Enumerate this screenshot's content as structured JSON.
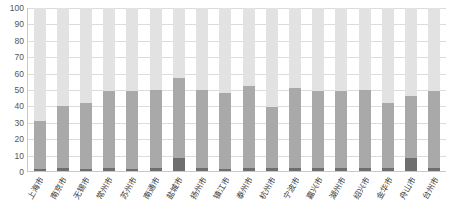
{
  "chart_data": {
    "type": "bar",
    "stacked": true,
    "title": "",
    "subtitle": "",
    "xlabel": "",
    "ylabel": "",
    "ylim": [
      0,
      100
    ],
    "ytick_step": 10,
    "grid": true,
    "legend": "none",
    "yticks": [
      "100",
      "90",
      "80",
      "70",
      "60",
      "50",
      "40",
      "30",
      "20",
      "10",
      "0"
    ],
    "categories": [
      "上海市",
      "南京市",
      "无锡市",
      "常州市",
      "苏州市",
      "南通市",
      "盐城市",
      "扬州市",
      "镇江市",
      "泰州市",
      "杭州市",
      "宁波市",
      "嘉兴市",
      "湖州市",
      "绍兴市",
      "金华市",
      "舟山市",
      "台州市"
    ],
    "series": [
      {
        "name": "bottom-segment",
        "color": "#6e6e6e",
        "values": [
          1,
          2,
          1,
          2,
          1,
          2,
          8,
          2,
          1,
          2,
          2,
          2,
          2,
          2,
          2,
          2,
          8,
          2
        ]
      },
      {
        "name": "middle-segment",
        "color": "#a9a9a9",
        "values": [
          30,
          38,
          41,
          47,
          48,
          48,
          49,
          48,
          47,
          50,
          37,
          49,
          47,
          47,
          48,
          40,
          38,
          47
        ]
      },
      {
        "name": "top-segment",
        "color": "#e2e2e2",
        "values": [
          69,
          60,
          58,
          51,
          51,
          50,
          43,
          50,
          52,
          48,
          61,
          49,
          51,
          51,
          50,
          58,
          54,
          51
        ]
      }
    ],
    "stack_totals": [
      100,
      100,
      100,
      100,
      100,
      100,
      100,
      100,
      100,
      100,
      100,
      100,
      100,
      100,
      100,
      100,
      100,
      100
    ],
    "cumulative_to_mid": [
      31,
      40,
      42,
      49,
      49,
      50,
      57,
      50,
      48,
      52,
      39,
      51,
      49,
      49,
      50,
      42,
      46,
      49
    ]
  },
  "colors": {
    "segment_bottom": "#6e6e6e",
    "segment_middle": "#a9a9a9",
    "segment_top": "#e2e2e2",
    "gridline": "#dcdcdc",
    "axis": "#c8c8c8",
    "tick_text": "#555555",
    "label_text": "#3a3a3a",
    "background": "#ffffff"
  }
}
